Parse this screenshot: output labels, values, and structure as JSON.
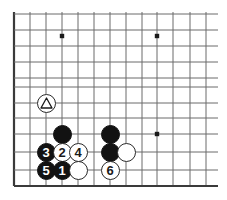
{
  "diagram": {
    "type": "go-board-diagram",
    "title": "",
    "board": {
      "grid_color": "#6b6b6b",
      "edge_color": "#3a3a3a",
      "background_color": "#ffffff",
      "line_spacing_px": 16,
      "x_lines": [
        14,
        30,
        46,
        62,
        78,
        94,
        110,
        126,
        142,
        157,
        173,
        190,
        206
      ],
      "y_lines": [
        14,
        30,
        46,
        62,
        78,
        87,
        103,
        118,
        134,
        152,
        170,
        186
      ],
      "left_edge_x": 14,
      "bottom_edge_y": 186,
      "right_extent_x": 218,
      "top_extent_y": 12
    },
    "star_points": [
      {
        "name": "star-point-upper-left",
        "x": 62,
        "y": 36
      },
      {
        "name": "star-point-upper-right",
        "x": 157,
        "y": 36
      },
      {
        "name": "star-point-lower-right",
        "x": 157,
        "y": 134
      }
    ],
    "stones": [
      {
        "name": "white-stone-triangle-marked",
        "color": "white",
        "label": "",
        "mark": "triangle",
        "x": 46,
        "y": 103
      },
      {
        "name": "black-stone-unnumbered-left",
        "color": "black",
        "label": "",
        "mark": "",
        "x": 62,
        "y": 134
      },
      {
        "name": "black-stone-3",
        "color": "black",
        "label": "3",
        "mark": "",
        "x": 46,
        "y": 152
      },
      {
        "name": "white-stone-2",
        "color": "white",
        "label": "2",
        "mark": "",
        "x": 62,
        "y": 152
      },
      {
        "name": "white-stone-4",
        "color": "white",
        "label": "4",
        "mark": "",
        "x": 78,
        "y": 152
      },
      {
        "name": "black-stone-5",
        "color": "black",
        "label": "5",
        "mark": "",
        "x": 46,
        "y": 170
      },
      {
        "name": "black-stone-1",
        "color": "black",
        "label": "1",
        "mark": "",
        "x": 62,
        "y": 170
      },
      {
        "name": "white-stone-unnumbered-bottom-left",
        "color": "white",
        "label": "",
        "mark": "",
        "x": 78,
        "y": 170
      },
      {
        "name": "black-stone-unnumbered-right-upper",
        "color": "black",
        "label": "",
        "mark": "",
        "x": 110,
        "y": 134
      },
      {
        "name": "black-stone-unnumbered-right-lower",
        "color": "black",
        "label": "",
        "mark": "",
        "x": 110,
        "y": 152
      },
      {
        "name": "white-stone-unnumbered-right",
        "color": "white",
        "label": "",
        "mark": "",
        "x": 126,
        "y": 152
      },
      {
        "name": "white-stone-6",
        "color": "white",
        "label": "6",
        "mark": "",
        "x": 110,
        "y": 170
      }
    ]
  }
}
